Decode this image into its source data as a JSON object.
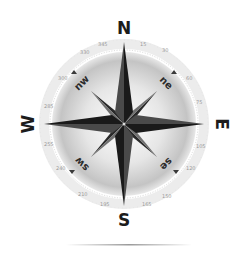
{
  "image": {
    "subject": "compass rose",
    "cardinals": {
      "north": "N",
      "east": "E",
      "south": "S",
      "west": "W"
    },
    "intercardinals": {
      "northeast": "ne",
      "southeast": "se",
      "southwest": "sw",
      "northwest": "nw"
    },
    "colors": {
      "background": "#ffffff",
      "star_dark": "#1e1e1e",
      "star_mid": "#5a5a5a",
      "disc_center": "#ffffff",
      "disc_edge": "#cfcfcf",
      "labels": "#1c1c1c"
    }
  }
}
